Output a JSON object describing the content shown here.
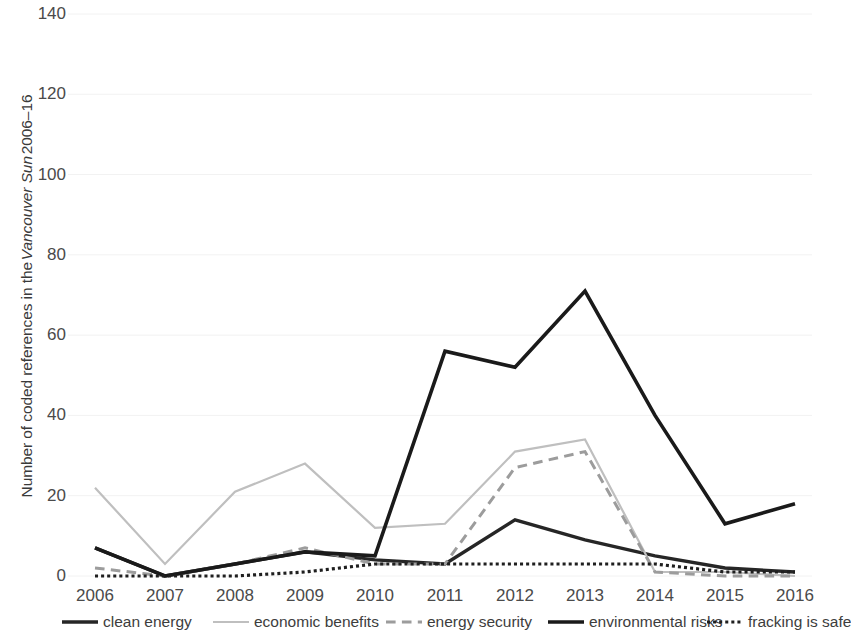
{
  "chart_data": {
    "type": "line",
    "title": "",
    "xlabel": "",
    "ylabel": "Number of coded references in the Vancouver Sun 2006–16",
    "ylabel_parts": {
      "before": "Number of coded references in the ",
      "italic": "Vancouver Sun",
      "after": " 2006–16"
    },
    "categories": [
      "2006",
      "2007",
      "2008",
      "2009",
      "2010",
      "2011",
      "2012",
      "2013",
      "2014",
      "2015",
      "2016"
    ],
    "x": [
      2006,
      2007,
      2008,
      2009,
      2010,
      2011,
      2012,
      2013,
      2014,
      2015,
      2016
    ],
    "ylim": [
      0,
      140
    ],
    "yticks": [
      0,
      20,
      40,
      60,
      80,
      100,
      120,
      140
    ],
    "ytick_labels": [
      "0",
      "20",
      "40",
      "60",
      "80",
      "100",
      "120",
      "140"
    ],
    "grid": true,
    "grid_color": "#f2f2f2",
    "legend_position": "bottom",
    "series": [
      {
        "name": "clean energy",
        "color": "#262626",
        "style": "solid",
        "width": 3.4,
        "values": [
          7,
          0,
          3,
          6,
          4,
          3,
          14,
          9,
          5,
          2,
          1
        ]
      },
      {
        "name": "economic benefits",
        "color": "#bfbfbf",
        "style": "solid",
        "width": 2.2,
        "values": [
          22,
          3,
          21,
          28,
          12,
          13,
          31,
          34,
          1,
          1,
          0
        ]
      },
      {
        "name": "energy security",
        "color": "#9c9c9c",
        "style": "dashed",
        "width": 3.0,
        "values": [
          2,
          0,
          3,
          7,
          3,
          3,
          27,
          31,
          1,
          0,
          0
        ]
      },
      {
        "name": "environmental risks",
        "color": "#1a1a1a",
        "style": "solid",
        "width": 3.6,
        "values": [
          7,
          0,
          3,
          6,
          5,
          56,
          52,
          71,
          40,
          13,
          18
        ]
      },
      {
        "name": "fracking is safe",
        "color": "#1f1f1f",
        "style": "dotted",
        "width": 3.2,
        "values": [
          0,
          0,
          0,
          1,
          3,
          3,
          3,
          3,
          3,
          1,
          1
        ]
      }
    ]
  },
  "legend": {
    "items": [
      {
        "label": "clean energy"
      },
      {
        "label": "economic benefits"
      },
      {
        "label": "energy security"
      },
      {
        "label": "environmental risks"
      },
      {
        "label": "fracking is safe"
      }
    ]
  }
}
